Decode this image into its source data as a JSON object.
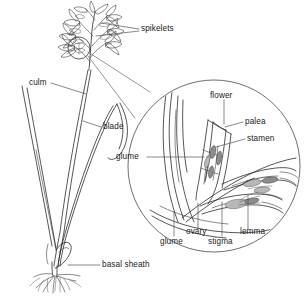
{
  "figure": {
    "background_color": "#ffffff",
    "ink_color": "#2b2b2b"
  },
  "plant_labels": {
    "spikelets": "spikelets",
    "culm": "culm",
    "blade": "blade",
    "basal_sheath": "basal sheath"
  },
  "lens_labels": {
    "flower": "flower",
    "palea": "palea",
    "stamen": "stamen",
    "glume_left": "glume",
    "glume_bottom": "glume",
    "ovary": "ovary",
    "stigma": "stigma",
    "lemma": "lemma"
  }
}
